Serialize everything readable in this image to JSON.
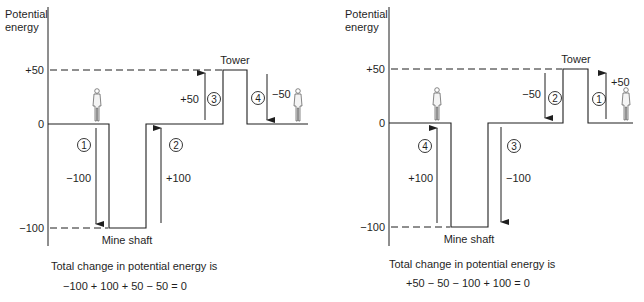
{
  "panels": [
    {
      "id": "left",
      "axis_label_line1": "Potential",
      "axis_label_line2": "energy",
      "ticks": {
        "plus50": "+50",
        "zero": "0",
        "minus100": "−100"
      },
      "tower_label": "Tower",
      "shaft_label": "Mine shaft",
      "steps": [
        {
          "num": "1",
          "value": "−100",
          "direction": "down"
        },
        {
          "num": "2",
          "value": "+100",
          "direction": "up"
        },
        {
          "num": "3",
          "value": "+50",
          "direction": "up"
        },
        {
          "num": "4",
          "value": "−50",
          "direction": "down"
        }
      ],
      "caption_line1": "Total change in potential energy is",
      "caption_line2": "−100 + 100 + 50 − 50 = 0"
    },
    {
      "id": "right",
      "axis_label_line1": "Potential",
      "axis_label_line2": "energy",
      "ticks": {
        "plus50": "+50",
        "zero": "0",
        "minus100": "−100"
      },
      "tower_label": "Tower",
      "shaft_label": "Mine shaft",
      "steps": [
        {
          "num": "1",
          "value": "+50",
          "direction": "up"
        },
        {
          "num": "2",
          "value": "−50",
          "direction": "down"
        },
        {
          "num": "3",
          "value": "−100",
          "direction": "down"
        },
        {
          "num": "4",
          "value": "+100",
          "direction": "up"
        }
      ],
      "caption_line1": "Total change in potential energy is",
      "caption_line2": "+50 − 50 − 100 + 100 = 0"
    }
  ],
  "colors": {
    "ink": "#1f1f1f",
    "background": "#ffffff"
  }
}
